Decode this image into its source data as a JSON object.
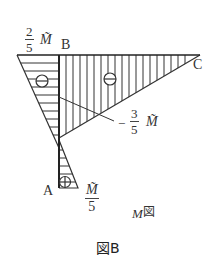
{
  "figure": {
    "caption": "図B",
    "diagram_title": "M図",
    "diagram_title_M": "M",
    "diagram_title_suffix": "図"
  },
  "points": {
    "A": "A",
    "B": "B",
    "C": "C"
  },
  "moment_labels": {
    "left_top": {
      "num": "2",
      "den": "5",
      "symbol": "M̃"
    },
    "middle": {
      "sign": "−",
      "num": "3",
      "den": "5",
      "symbol": "M̃"
    },
    "bottom": {
      "num": "M̃",
      "den": "5"
    }
  },
  "signs": {
    "left_triangle": "⊖",
    "right_triangle": "⊖",
    "bottom_triangle": "⊕"
  }
}
